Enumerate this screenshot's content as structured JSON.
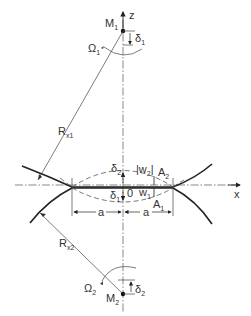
{
  "diagram": {
    "labels": {
      "z_axis": "z",
      "x_axis": "x",
      "center_1": "M",
      "center_1_sub": "1",
      "center_2": "M",
      "center_2_sub": "2",
      "radius_1": "R",
      "radius_1_sub": "x1",
      "radius_2": "R",
      "radius_2_sub": "x2",
      "omega_1": "Ω",
      "omega_1_sub": "1",
      "omega_2": "Ω",
      "omega_2_sub": "2",
      "delta_1_top": "δ",
      "delta_1_top_sub": "1",
      "delta_2_bottom": "δ",
      "delta_2_bottom_sub": "2",
      "delta_2_center": "δ",
      "delta_2_center_sub": "2",
      "delta_1_center": "δ",
      "delta_1_center_sub": "1",
      "origin": "0",
      "w2": "|w",
      "w2_sub": "2",
      "w2_end": "|",
      "w1": "w",
      "w1_sub": "1",
      "point_A2": "A",
      "point_A2_sub": "2",
      "point_A1": "A",
      "point_A1_sub": "1",
      "half_width_left": "a",
      "half_width_right": "a"
    }
  }
}
